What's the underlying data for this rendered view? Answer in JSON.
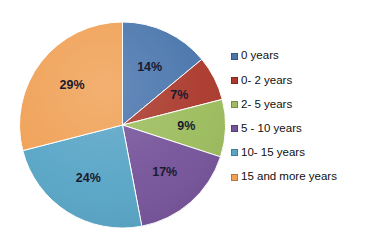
{
  "chart_data": {
    "type": "pie",
    "title": "",
    "categories": [
      "0 years",
      "0- 2 years",
      "2- 5 years",
      "5 - 10 years",
      "10- 15 years",
      "15 and more years"
    ],
    "values": [
      14,
      7,
      9,
      17,
      24,
      29
    ],
    "value_labels": [
      "14%",
      "7%",
      "9%",
      "17%",
      "24%",
      "29%"
    ],
    "colors": [
      "#4a76ad",
      "#ab3a2d",
      "#9dbd5e",
      "#76549a",
      "#58a5c6",
      "#f0a156"
    ],
    "units": "percent",
    "start_angle_deg": 0,
    "direction": "clockwise",
    "legend_position": "right",
    "grid": false,
    "xlabel": "",
    "ylabel": ""
  },
  "legend": {
    "items": [
      {
        "label": "0 years",
        "color": "#4a76ad",
        "value_label": "14%"
      },
      {
        "label": "0- 2 years",
        "color": "#ab3a2d",
        "value_label": "7%"
      },
      {
        "label": "2- 5 years",
        "color": "#9dbd5e",
        "value_label": "9%"
      },
      {
        "label": "5 - 10 years",
        "color": "#76549a",
        "value_label": "17%"
      },
      {
        "label": "10- 15 years",
        "color": "#58a5c6",
        "value_label": "24%"
      },
      {
        "label": "15 and more years",
        "color": "#f0a156",
        "value_label": "29%"
      }
    ]
  },
  "slices": {
    "s0": "14%",
    "s1": "7%",
    "s2": "9%",
    "s3": "17%",
    "s4": "24%",
    "s5": "29%"
  },
  "canvas": {
    "background": "#ffffff",
    "label_color": "#1a1a2e"
  }
}
